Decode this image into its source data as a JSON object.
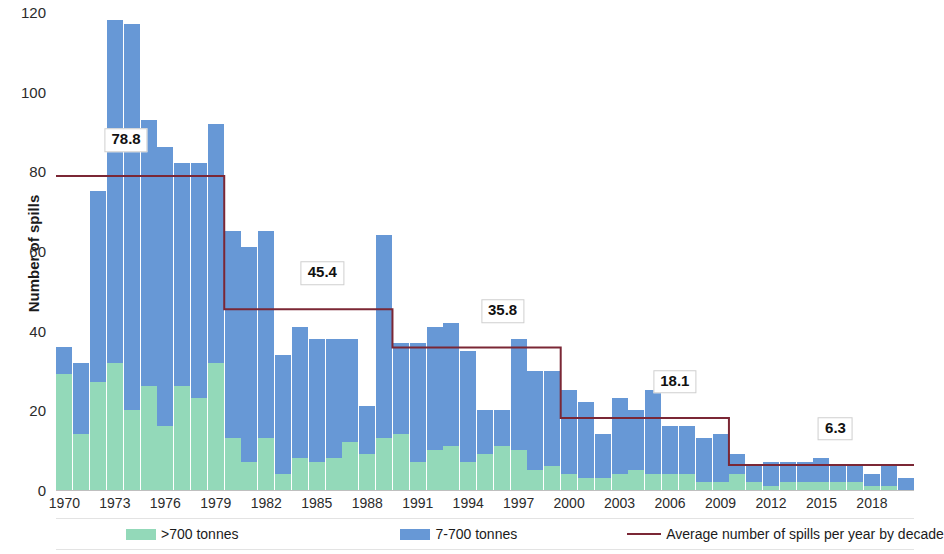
{
  "chart_data": {
    "type": "bar",
    "title": "",
    "xlabel": "",
    "ylabel": "Number of spills",
    "ylim": [
      0,
      120
    ],
    "ytick_step": 20,
    "yticks": [
      "0",
      "20",
      "40",
      "60",
      "80",
      "100",
      "120"
    ],
    "grid": false,
    "stacked": true,
    "legend_position": "bottom",
    "categories": [
      "1970",
      "1971",
      "1972",
      "1973",
      "1974",
      "1975",
      "1976",
      "1977",
      "1978",
      "1979",
      "1980",
      "1981",
      "1982",
      "1983",
      "1984",
      "1985",
      "1986",
      "1987",
      "1988",
      "1989",
      "1990",
      "1991",
      "1992",
      "1993",
      "1994",
      "1995",
      "1996",
      "1997",
      "1998",
      "1999",
      "2000",
      "2001",
      "2002",
      "2003",
      "2004",
      "2005",
      "2006",
      "2007",
      "2008",
      "2009",
      "2010",
      "2011",
      "2012",
      "2013",
      "2014",
      "2015",
      "2016",
      "2017",
      "2018",
      "2019",
      "2020"
    ],
    "xtick_labels": [
      "1970",
      "1973",
      "1976",
      "1979",
      "1982",
      "1985",
      "1988",
      "1991",
      "1994",
      "1997",
      "2000",
      "2003",
      "2006",
      "2009",
      "2012",
      "2015",
      "2018"
    ],
    "series": [
      {
        "name": ">700 tonnes",
        "color": "#93d9b9",
        "values": [
          29,
          14,
          27,
          32,
          20,
          26,
          16,
          26,
          23,
          32,
          13,
          7,
          13,
          4,
          8,
          7,
          8,
          12,
          9,
          13,
          14,
          7,
          10,
          11,
          7,
          9,
          11,
          10,
          5,
          6,
          4,
          3,
          3,
          4,
          5,
          4,
          4,
          4,
          2,
          2,
          4,
          2,
          1,
          2,
          2,
          2,
          2,
          2,
          1,
          1,
          0
        ]
      },
      {
        "name": "7-700 tonnes",
        "color": "#6798d6",
        "values": [
          7,
          18,
          48,
          86,
          97,
          67,
          70,
          56,
          59,
          60,
          52,
          54,
          52,
          30,
          33,
          31,
          30,
          26,
          12,
          51,
          23,
          30,
          31,
          31,
          28,
          11,
          9,
          28,
          25,
          24,
          21,
          19,
          11,
          19,
          15,
          21,
          12,
          12,
          11,
          12,
          5,
          4,
          6,
          5,
          5,
          6,
          4,
          4,
          3,
          5,
          3
        ]
      }
    ],
    "stack_totals": [
      36,
      32,
      75,
      118,
      117,
      93,
      86,
      82,
      82,
      92,
      65,
      61,
      65,
      34,
      41,
      38,
      38,
      38,
      21,
      64,
      37,
      37,
      41,
      42,
      35,
      20,
      20,
      38,
      30,
      30,
      25,
      22,
      14,
      23,
      20,
      25,
      16,
      16,
      13,
      14,
      9,
      6,
      7,
      7,
      7,
      8,
      6,
      6,
      4,
      6,
      3
    ],
    "average_line": {
      "name": "Average number of spills per year by decade",
      "color": "#7b2735",
      "segments": [
        {
          "label": "78.8",
          "value": 78.8,
          "start_year": "1970",
          "end_year": "1979"
        },
        {
          "label": "45.4",
          "value": 45.4,
          "start_year": "1980",
          "end_year": "1989"
        },
        {
          "label": "35.8",
          "value": 35.8,
          "start_year": "1990",
          "end_year": "1999"
        },
        {
          "label": "18.1",
          "value": 18.1,
          "start_year": "2000",
          "end_year": "2009"
        },
        {
          "label": "6.3",
          "value": 6.3,
          "start_year": "2010",
          "end_year": "2020"
        }
      ]
    },
    "legend": [
      {
        "label": ">700 tonnes",
        "color": "#93d9b9",
        "marker": "square"
      },
      {
        "label": "7-700 tonnes",
        "color": "#6798d6",
        "marker": "square"
      },
      {
        "label": "Average number of spills per year by decade",
        "color": "#7b2735",
        "marker": "line"
      }
    ]
  }
}
